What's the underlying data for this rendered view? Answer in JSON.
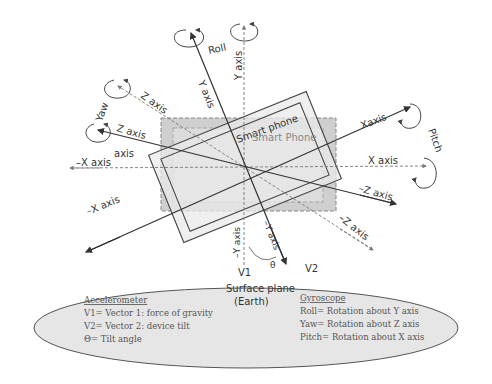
{
  "diagram": {
    "phone_labels": {
      "tilted": "Smart phone",
      "reference": "Smart Phone"
    },
    "rotations": {
      "roll": "Roll",
      "yaw": "Yaw",
      "pitch": "Pitch"
    },
    "axes": {
      "y_tilted": "Y axis",
      "y_ref": "Y axis",
      "z_tilted": "Z axis",
      "z_ref": "Z axis",
      "x_tilted": "Xaxis",
      "x_ref": "X axis",
      "neg_x_tilted": "–X axis",
      "neg_x_ref": "–X axis",
      "neg_z_tilted": "–Z axis",
      "neg_z_ref": "–Z axis",
      "neg_y_ref": "–Y axis",
      "neg_y_tilted": "–Y axis",
      "stray_axis": "axis"
    },
    "vectors": {
      "v1": "V1",
      "v2": "V2",
      "theta": "θ"
    },
    "surface": {
      "line1": "Surface plane",
      "line2": "(Earth)"
    },
    "accelerometer": {
      "heading": "Accelerometer",
      "items": [
        "V1= Vector 1: force of gravity",
        "V2= Vector 2: device tilt",
        "Θ= Tilt angle"
      ]
    },
    "gyroscope": {
      "heading": "Gyroscope",
      "items": [
        "Roll= Rotation about Y axis",
        "Yaw= Rotation about Z axis",
        "Pitch= Rotation about X axis"
      ]
    },
    "colors": {
      "ellipse_fill": "#e6e6e6",
      "reference_phone_fill": "#cfcfcf",
      "tilted_phone_fill": "#e9e9e9",
      "line": "#333333"
    }
  }
}
